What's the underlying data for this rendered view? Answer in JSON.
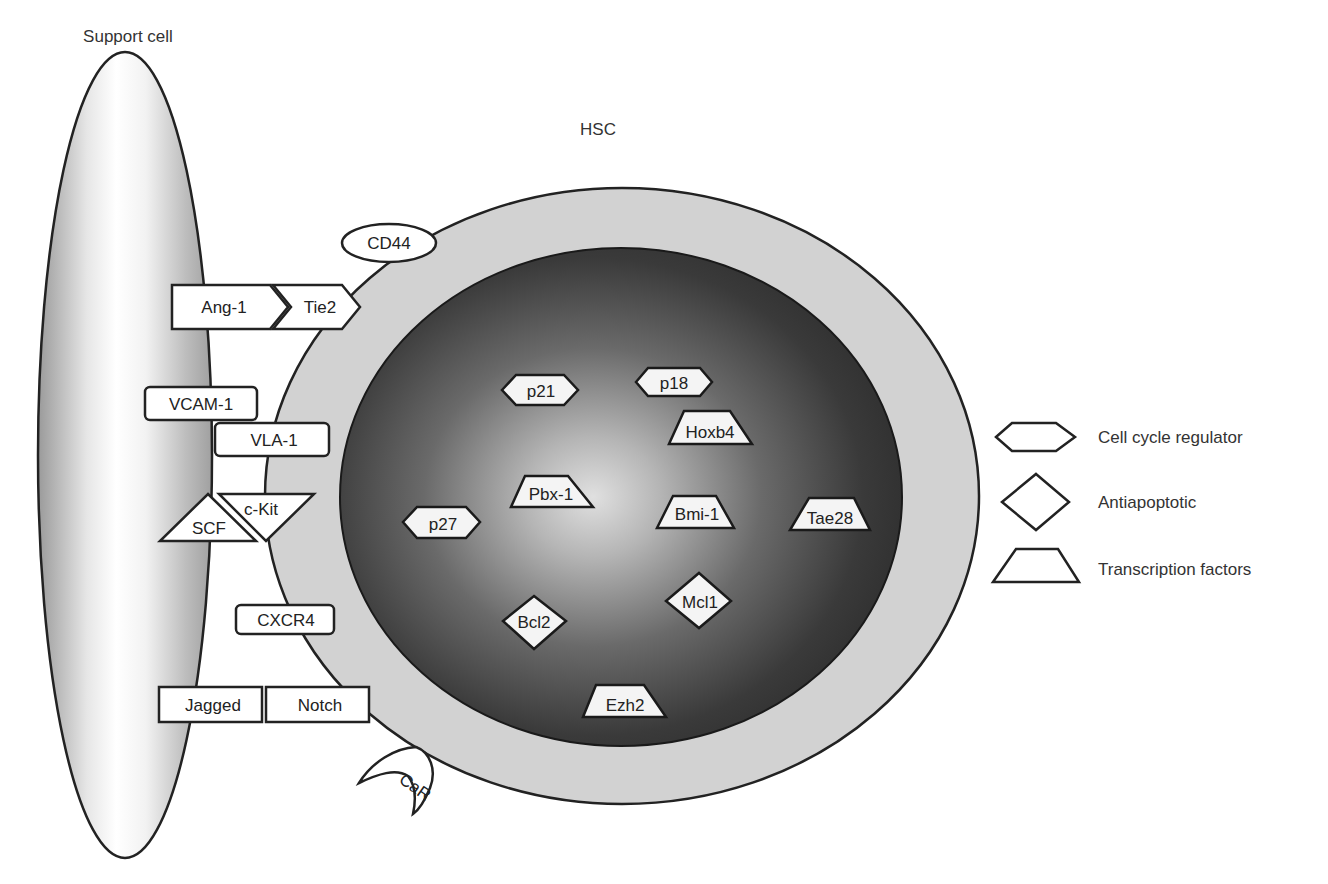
{
  "titles": {
    "support_cell": "Support cell",
    "hsc": "HSC"
  },
  "membrane_molecules": {
    "cd44": "CD44",
    "ang1": "Ang-1",
    "tie2": "Tie2",
    "vcam1": "VCAM-1",
    "vla1": "VLA-1",
    "scf": "SCF",
    "ckit": "c-Kit",
    "cxcr4": "CXCR4",
    "jagged": "Jagged",
    "notch": "Notch",
    "car": "CaR"
  },
  "nuclear_factors": {
    "p18": {
      "label": "p18",
      "type": "Cell cycle regulator"
    },
    "p21": {
      "label": "p21",
      "type": "Cell cycle regulator"
    },
    "p27": {
      "label": "p27",
      "type": "Cell cycle regulator"
    },
    "hoxb4": {
      "label": "Hoxb4",
      "type": "Transcription factors"
    },
    "pbx1": {
      "label": "Pbx-1",
      "type": "Transcription factors"
    },
    "bmi1": {
      "label": "Bmi-1",
      "type": "Transcription factors"
    },
    "tae28": {
      "label": "Tae28",
      "type": "Transcription factors"
    },
    "ezh2": {
      "label": "Ezh2",
      "type": "Transcription factors"
    },
    "bcl2": {
      "label": "Bcl2",
      "type": "Antiapoptotic"
    },
    "mcl1": {
      "label": "Mcl1",
      "type": "Antiapoptotic"
    }
  },
  "legend": {
    "items": [
      {
        "shape": "hexagon",
        "label": "Cell cycle regulator"
      },
      {
        "shape": "diamond",
        "label": "Antiapoptotic"
      },
      {
        "shape": "trapezoid",
        "label": "Transcription factors"
      }
    ]
  }
}
